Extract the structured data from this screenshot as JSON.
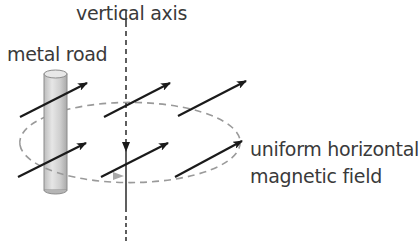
{
  "diagram": {
    "labels": {
      "vertical_axis": "vertical axis",
      "metal_rod": "metal road",
      "field_line1": "uniform horizontal",
      "field_line2": "magnetic field"
    },
    "colors": {
      "text": "#3a3a3a",
      "arrow": "#1a1a1a",
      "dashed_path": "#9a9a9a",
      "rod_fill": "#d4d4d4",
      "rod_edge": "#8c8c8c"
    },
    "field_arrow_count": 6,
    "rotation_direction": "counter-clockwise viewed from above"
  }
}
